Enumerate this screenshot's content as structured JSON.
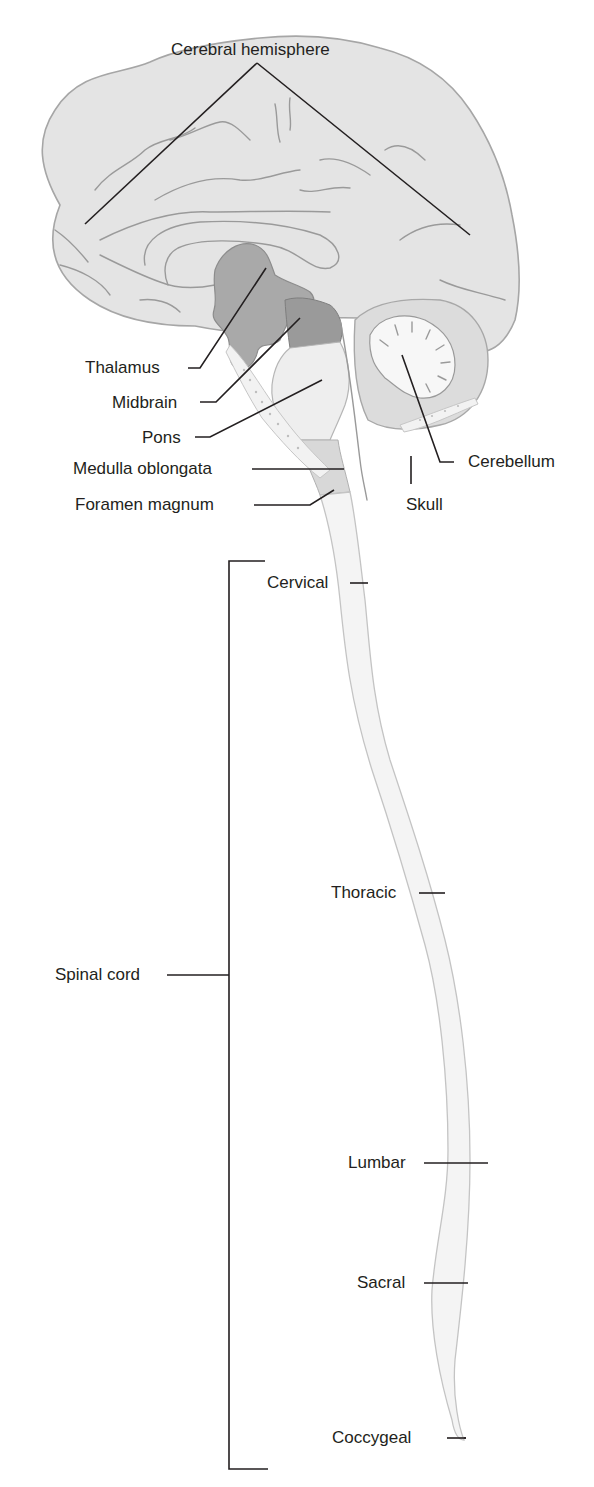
{
  "diagram": {
    "colors": {
      "cerebrum": "#e4e4e4",
      "thalamus": "#a9a9a9",
      "midbrain": "#9a9a9a",
      "pons": "#eeeeee",
      "medulla": "#d8d8d8",
      "cerebellum": "#dcdcdc",
      "arbor_vitae": "#f7f7f7",
      "spinal_cord": "#f4f4f4",
      "leader_line": "#231f20"
    },
    "labels": {
      "cerebral_hemisphere": "Cerebral hemisphere",
      "thalamus": "Thalamus",
      "midbrain": "Midbrain",
      "pons": "Pons",
      "medulla_oblongata": "Medulla oblongata",
      "foramen_magnum": "Foramen magnum",
      "cerebellum": "Cerebellum",
      "skull": "Skull",
      "spinal_cord": "Spinal cord"
    },
    "spinal_regions": [
      {
        "label": "Cervical"
      },
      {
        "label": "Thoracic"
      },
      {
        "label": "Lumbar"
      },
      {
        "label": "Sacral"
      },
      {
        "label": "Coccygeal"
      }
    ]
  }
}
